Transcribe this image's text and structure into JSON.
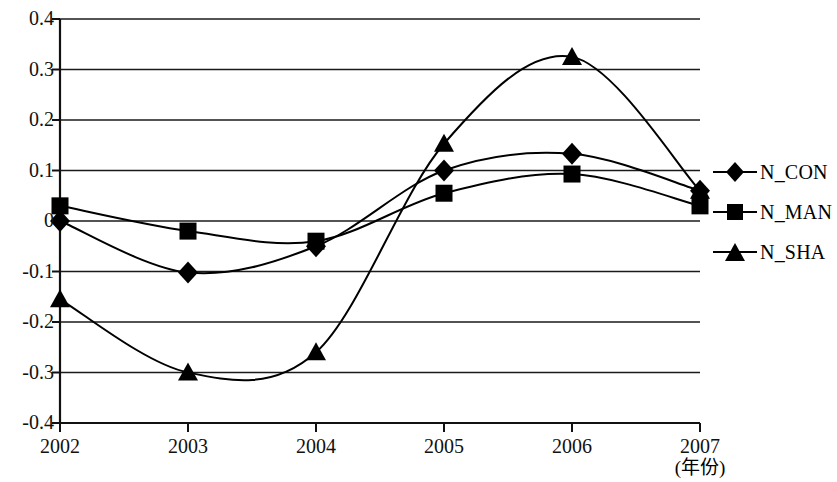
{
  "chart_data": {
    "type": "line",
    "title": "",
    "subtitle": "",
    "xlabel": "(年份)",
    "ylabel": "",
    "categories": [
      "2002",
      "2003",
      "2004",
      "2005",
      "2006",
      "2007"
    ],
    "x": [
      2002,
      2003,
      2004,
      2005,
      2006,
      2007
    ],
    "xlim": [
      2002,
      2007
    ],
    "ylim": [
      -0.4,
      0.4
    ],
    "yticks": [
      "0.4",
      "0.3",
      "0.2",
      "0.1",
      "0",
      "-0.1",
      "-0.2",
      "-0.3",
      "-0.4"
    ],
    "ytick_values": [
      0.4,
      0.3,
      0.2,
      0.1,
      0,
      -0.1,
      -0.2,
      -0.3,
      -0.4
    ],
    "grid": "horizontal",
    "legend_position": "right",
    "smoothing": "spline",
    "series": [
      {
        "name": "N_CON",
        "marker": "diamond",
        "color": "#000000",
        "values": [
          0.0,
          -0.102,
          -0.05,
          0.1,
          0.133,
          0.06
        ]
      },
      {
        "name": "N_MAN",
        "marker": "square",
        "color": "#000000",
        "values": [
          0.03,
          -0.02,
          -0.04,
          0.055,
          0.093,
          0.03
        ]
      },
      {
        "name": "N_SHA",
        "marker": "triangle",
        "color": "#000000",
        "values": [
          -0.155,
          -0.3,
          -0.26,
          0.153,
          0.325,
          0.06
        ]
      }
    ]
  },
  "legend": {
    "items": [
      {
        "label": "N_CON",
        "marker": "diamond"
      },
      {
        "label": "N_MAN",
        "marker": "square"
      },
      {
        "label": "N_SHA",
        "marker": "triangle"
      }
    ]
  },
  "axes": {
    "x_unit_note": "(年份)"
  }
}
